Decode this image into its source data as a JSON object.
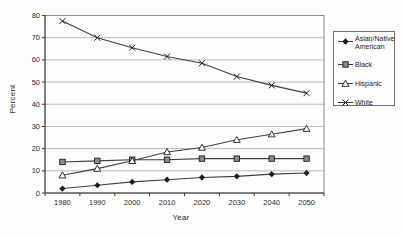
{
  "chart_data": {
    "type": "line",
    "categories": [
      "1980",
      "1990",
      "2000",
      "2010",
      "2020",
      "2030",
      "2040",
      "2050"
    ],
    "series": [
      {
        "name": "Asian/Native American",
        "marker": "diamond",
        "values": [
          2,
          3.5,
          5,
          6,
          7,
          7.5,
          8.5,
          9
        ]
      },
      {
        "name": "Black",
        "marker": "square",
        "values": [
          14,
          14.5,
          15,
          15,
          15.5,
          15.5,
          15.5,
          15.5
        ]
      },
      {
        "name": "Hispanic",
        "marker": "triangle",
        "values": [
          8,
          11,
          14.5,
          18.5,
          20.5,
          24,
          26.5,
          29
        ]
      },
      {
        "name": "White",
        "marker": "x",
        "values": [
          77.5,
          70,
          65.5,
          61.5,
          58.5,
          52.5,
          48.5,
          45
        ]
      }
    ],
    "title": "",
    "xlabel": "Year",
    "ylabel": "Percent",
    "ylim": [
      0,
      80
    ],
    "yticks": [
      0,
      10,
      20,
      30,
      40,
      50,
      60,
      70,
      80
    ],
    "grid": true,
    "legend_position": "right"
  },
  "colors": {
    "background": "#fdfdfd",
    "text": "#2a2a2a",
    "grid": "#b9b9b9",
    "axis": "#3c3c3c",
    "plot_border": "#8a8a8a",
    "series_line": "#3f3f3f",
    "marker_dark": "#1c1c1c",
    "square_fill": "#8c8c8c",
    "triangle_fill": "#ffffff"
  }
}
